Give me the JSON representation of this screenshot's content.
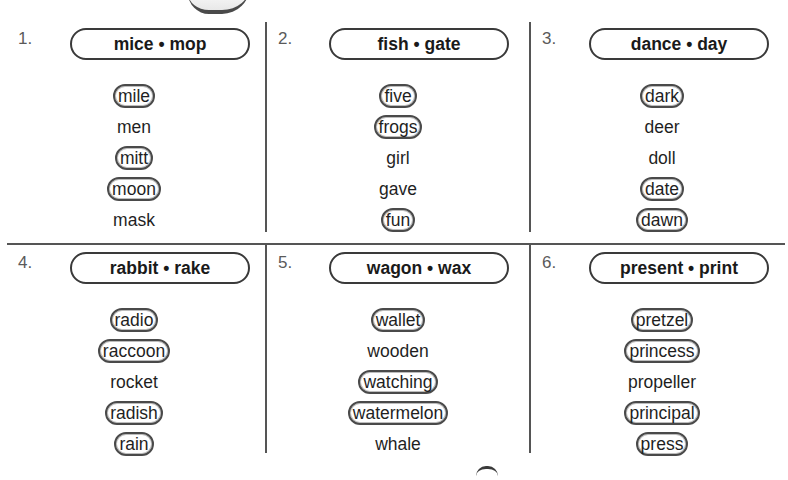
{
  "worksheet": {
    "groups": [
      {
        "number": "1.",
        "guide_words": "mice • mop",
        "words": [
          {
            "text": "mile",
            "circled": true
          },
          {
            "text": "men",
            "circled": false
          },
          {
            "text": "mitt",
            "circled": true
          },
          {
            "text": "moon",
            "circled": true
          },
          {
            "text": "mask",
            "circled": false
          }
        ]
      },
      {
        "number": "2.",
        "guide_words": "fish • gate",
        "words": [
          {
            "text": "five",
            "circled": true
          },
          {
            "text": "frogs",
            "circled": true
          },
          {
            "text": "girl",
            "circled": false
          },
          {
            "text": "gave",
            "circled": false
          },
          {
            "text": "fun",
            "circled": true
          }
        ]
      },
      {
        "number": "3.",
        "guide_words": "dance • day",
        "words": [
          {
            "text": "dark",
            "circled": true
          },
          {
            "text": "deer",
            "circled": false
          },
          {
            "text": "doll",
            "circled": false
          },
          {
            "text": "date",
            "circled": true
          },
          {
            "text": "dawn",
            "circled": true
          }
        ]
      },
      {
        "number": "4.",
        "guide_words": "rabbit • rake",
        "words": [
          {
            "text": "radio",
            "circled": true
          },
          {
            "text": "raccoon",
            "circled": true
          },
          {
            "text": "rocket",
            "circled": false
          },
          {
            "text": "radish",
            "circled": true
          },
          {
            "text": "rain",
            "circled": true
          }
        ]
      },
      {
        "number": "5.",
        "guide_words": "wagon • wax",
        "words": [
          {
            "text": "wallet",
            "circled": true
          },
          {
            "text": "wooden",
            "circled": false
          },
          {
            "text": "watching",
            "circled": true
          },
          {
            "text": "watermelon",
            "circled": true
          },
          {
            "text": "whale",
            "circled": false
          }
        ]
      },
      {
        "number": "6.",
        "guide_words": "present • print",
        "words": [
          {
            "text": "pretzel",
            "circled": true
          },
          {
            "text": "princess",
            "circled": true
          },
          {
            "text": "propeller",
            "circled": false
          },
          {
            "text": "principal",
            "circled": true
          },
          {
            "text": "press",
            "circled": true
          }
        ]
      }
    ]
  }
}
